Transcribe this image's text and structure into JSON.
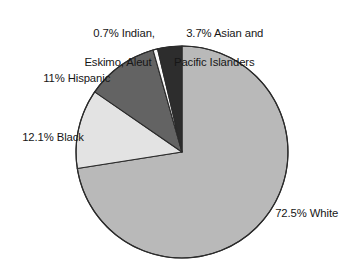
{
  "chart_data": {
    "type": "pie",
    "title": "",
    "subtitle": "",
    "xlabel": "",
    "ylabel": "",
    "legend_position": "none",
    "grid": false,
    "units": "percent",
    "start_angle_deg": 0,
    "direction": "clockwise",
    "categories": [
      "White",
      "Black",
      "Hispanic",
      "Indian, Eskimo, Aleut",
      "Asian and Pacific Islanders"
    ],
    "values": [
      72.5,
      12.1,
      11,
      0.7,
      3.7
    ],
    "slices": [
      {
        "name": "White",
        "value": 72.5,
        "value_text": "72.5%",
        "label": "72.5% White",
        "color": "#b9b9b9"
      },
      {
        "name": "Black",
        "value": 12.1,
        "value_text": "12.1%",
        "label": "12.1% Black",
        "color": "#e3e3e3"
      },
      {
        "name": "Hispanic",
        "value": 11,
        "value_text": "11%",
        "label": "11% Hispanic",
        "color": "#636363"
      },
      {
        "name": "Indian, Eskimo, Aleut",
        "value": 0.7,
        "value_text": "0.7%",
        "label": "0.7% Indian, Eskimo, Aleut",
        "color": "#fbfbfb"
      },
      {
        "name": "Asian and Pacific Islanders",
        "value": 3.7,
        "value_text": "3.7%",
        "label": "3.7% Asian and Pacific Islanders",
        "color": "#2d2d2d"
      }
    ]
  },
  "labels": {
    "indian": {
      "line1": "0.7% Indian,",
      "line2": "Eskimo, Aleut"
    },
    "asian": {
      "line1": "3.7% Asian and",
      "line2": "Pacific Islanders"
    },
    "hispanic": {
      "line1": "11% Hispanic"
    },
    "black": {
      "line1": "12.1% Black"
    },
    "white": {
      "line1": "72.5% White"
    }
  },
  "style": {
    "background": "#ffffff",
    "text_color": "#161616",
    "outline_color": "#2b2b2b"
  }
}
